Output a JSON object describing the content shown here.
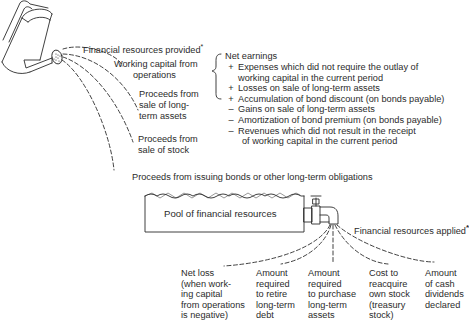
{
  "sources": {
    "header": "Financial resources provided",
    "header_mark": "*",
    "items": [
      {
        "lines": [
          "Working capital from",
          "operations"
        ]
      },
      {
        "lines": [
          "Proceeds from",
          "sale of long-",
          "term assets"
        ]
      },
      {
        "lines": [
          "Proceeds from",
          "sale of stock"
        ]
      },
      {
        "lines": [
          "Proceeds from issuing bonds or other long-term obligations"
        ]
      }
    ]
  },
  "operations_detail": {
    "title": "Net earnings",
    "adjustments": [
      {
        "sign": "+",
        "lines": [
          "Expenses which did not require the outlay of",
          "working capital in the current period"
        ]
      },
      {
        "sign": "+",
        "lines": [
          "Losses on sale of long-term assets"
        ]
      },
      {
        "sign": "+",
        "lines": [
          "Accumulation of bond discount (on bonds payable)"
        ]
      },
      {
        "sign": "–",
        "lines": [
          "Gains on sale of long-term assets"
        ]
      },
      {
        "sign": "–",
        "lines": [
          "Amortization of bond premium (on bonds payable)"
        ]
      },
      {
        "sign": "–",
        "lines": [
          "Revenues which did not result in the receipt",
          "of working capital in the current period"
        ]
      }
    ]
  },
  "pool": {
    "label": "Pool of financial resources"
  },
  "applications": {
    "header": "Financial resources applied",
    "header_mark": "*",
    "items": [
      {
        "lines": [
          "Net loss",
          "(when work-",
          "ing capital",
          "from operations",
          "is negative)"
        ]
      },
      {
        "lines": [
          "Amount",
          "required",
          "to retire",
          "long-term",
          "debt"
        ]
      },
      {
        "lines": [
          "Amount",
          "required",
          "to purchase",
          "long-term",
          "assets"
        ]
      },
      {
        "lines": [
          "Cost to",
          "reacquire",
          "own stock",
          "(treasury",
          "stock)"
        ]
      },
      {
        "lines": [
          "Amount",
          "of cash",
          "dividends",
          "declared"
        ]
      }
    ]
  },
  "colors": {
    "ink": "#2b2b2b",
    "background": "#ffffff"
  }
}
